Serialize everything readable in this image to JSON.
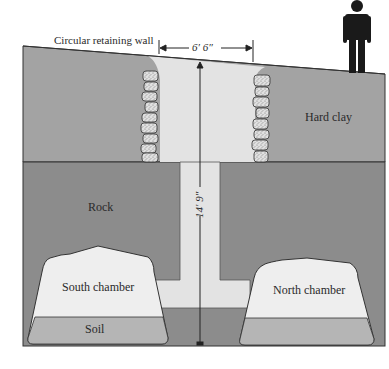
{
  "labels": {
    "retaining_wall": "Circular retaining wall",
    "width_dim": "6′ 6″",
    "height_dim": "14′ 9″",
    "hard_clay": "Hard clay",
    "rock": "Rock",
    "south_chamber": "South chamber",
    "north_chamber": "North chamber",
    "soil": "Soil"
  },
  "icons": {
    "person": "person-silhouette-icon"
  },
  "colors": {
    "hard_clay": "#a3a3a3",
    "rock": "#8c8c8c",
    "shaft": "#e3e3e3",
    "chamber": "#eeeeee",
    "soil": "#b5b5b5",
    "outline": "#333333",
    "stone": "#d8d8d8",
    "person": "#1a1a1a"
  }
}
